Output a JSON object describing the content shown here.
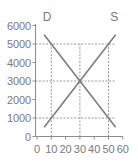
{
  "chart_data": {
    "type": "line",
    "title": "",
    "xlabel": "",
    "ylabel": "",
    "xlim": [
      0,
      60
    ],
    "ylim": [
      0,
      6000
    ],
    "x_ticks": [
      "0",
      "10",
      "20",
      "30",
      "40",
      "50",
      "60"
    ],
    "y_ticks": [
      "0",
      "1000",
      "2000",
      "3000",
      "4000",
      "5000",
      "6000"
    ],
    "grid": false,
    "legend": "none",
    "series": [
      {
        "name": "D",
        "label": "D",
        "x": [
          5,
          55
        ],
        "y": [
          5500,
          500
        ],
        "color": "#7d7d7d"
      },
      {
        "name": "S",
        "label": "S",
        "x": [
          5,
          55
        ],
        "y": [
          500,
          5500
        ],
        "color": "#7d7d7d"
      }
    ],
    "reference_lines": {
      "horizontal": [
        5000,
        3000,
        1000
      ],
      "vertical": [
        10,
        30,
        50
      ]
    },
    "annotations": [
      {
        "text": "D",
        "x": 7,
        "y": 6200
      },
      {
        "text": "S",
        "x": 54,
        "y": 6200
      }
    ],
    "colors": {
      "line": "#7d7d7d",
      "axis": "#8c8c8c",
      "dashed": "#7d7d7d",
      "text": "#7a7a7a"
    }
  }
}
